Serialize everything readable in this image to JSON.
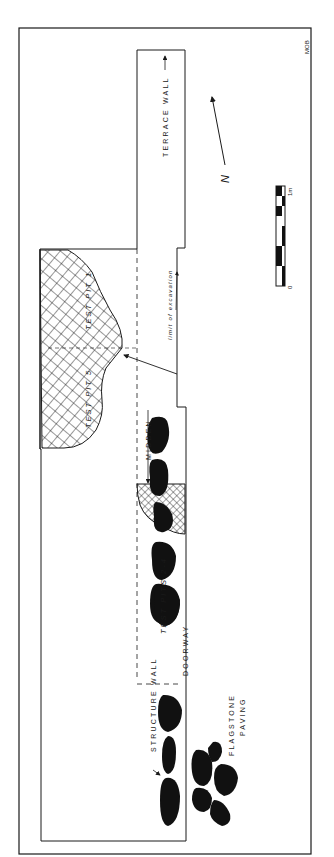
{
  "figure": {
    "type": "archaeological site plan",
    "initials": "MOB",
    "north_label": "N",
    "colors": {
      "ink": "#1a1a1a",
      "background": "#ffffff"
    }
  },
  "labels": {
    "terrace_wall": "TERRACE WALL",
    "test_pit_1": "TEST PIT 1",
    "test_pit_5": "TEST PIT 5",
    "limit_of_excavation": "limit of excavation",
    "midden": "MIDDEN",
    "test_pits_2_4": "TEST PITS 2-4",
    "structure_wall": "STRUCTURE WALL",
    "doorway": "DOORWAY",
    "flagstone": "FLAGSTONE",
    "paving": "PAVING"
  },
  "scale_bar": {
    "start_label": "0",
    "end_label": "1m",
    "segments": 5
  }
}
